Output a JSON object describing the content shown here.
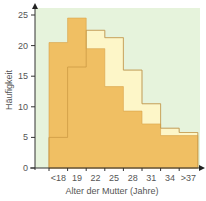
{
  "chart_data": {
    "type": "bar",
    "subtype": "step-histogram-overlay",
    "title": "",
    "xlabel": "Alter der Mutter (Jahre)",
    "ylabel": "Häufigkeit",
    "categories": [
      "<18",
      "19",
      "22",
      "25",
      "28",
      "31",
      "34",
      ">37"
    ],
    "series": [
      {
        "name": "Series A (orange)",
        "color": "#f0bf63",
        "values": [
          20.5,
          24.5,
          19.5,
          13.3,
          9.3,
          7.2,
          5.3,
          5.3
        ]
      },
      {
        "name": "Series B (light yellow)",
        "color": "#fdf6c8",
        "values": [
          5,
          16.5,
          22.5,
          21.3,
          16,
          10.5,
          6.5,
          5.8
        ]
      }
    ],
    "yticks": [
      0,
      5,
      10,
      15,
      20,
      25
    ],
    "ylim": [
      0,
      26
    ],
    "grid": false,
    "legend": "none",
    "background_color": "#e6f3dc"
  },
  "labels": {
    "ylabel": "Häufigkeit",
    "xlabel": "Alter der Mutter (Jahre)",
    "yticks": [
      "0",
      "5",
      "10",
      "15",
      "20",
      "25"
    ],
    "xticks": [
      "<18",
      "19",
      "22",
      "25",
      "28",
      "31",
      "34",
      ">37"
    ]
  }
}
